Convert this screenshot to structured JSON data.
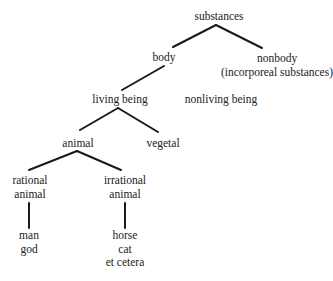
{
  "diagram": {
    "type": "tree",
    "nodes": {
      "substances": {
        "lines": [
          "substances"
        ]
      },
      "body": {
        "lines": [
          "body"
        ]
      },
      "nonbody": {
        "lines": [
          "nonbody",
          "(incorporeal substances)"
        ]
      },
      "living_being": {
        "lines": [
          "living being"
        ]
      },
      "nonliving_being": {
        "lines": [
          "nonliving being"
        ]
      },
      "animal": {
        "lines": [
          "animal"
        ]
      },
      "vegetal": {
        "lines": [
          "vegetal"
        ]
      },
      "rational_animal": {
        "lines": [
          "rational",
          "animal"
        ]
      },
      "irrational_animal": {
        "lines": [
          "irrational",
          "animal"
        ]
      },
      "rational_members": {
        "lines": [
          "man",
          "god"
        ]
      },
      "irrational_members": {
        "lines": [
          "horse",
          "cat",
          "et cetera"
        ]
      }
    },
    "edges": [
      [
        "substances",
        "body"
      ],
      [
        "substances",
        "nonbody"
      ],
      [
        "body",
        "living_being"
      ],
      [
        "living_being",
        "animal"
      ],
      [
        "living_being",
        "vegetal"
      ],
      [
        "animal",
        "rational_animal"
      ],
      [
        "animal",
        "irrational_animal"
      ],
      [
        "rational_animal",
        "rational_members"
      ],
      [
        "irrational_animal",
        "irrational_members"
      ]
    ]
  }
}
